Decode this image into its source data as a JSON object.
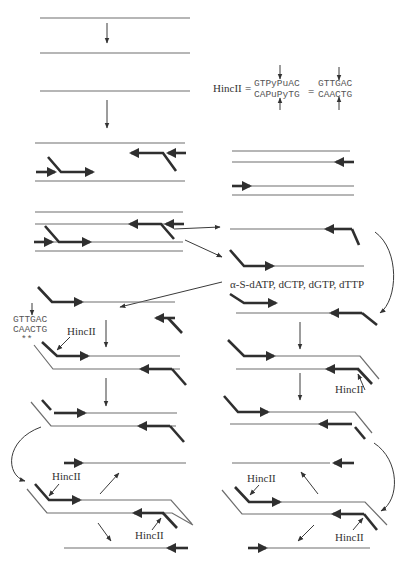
{
  "diagram": {
    "enzyme_label": "HincII",
    "equals": "=",
    "site_generic": {
      "top": "GTPyPuAC",
      "bottom": "CAPuPyTG"
    },
    "site_specific": {
      "top": "GTTGAC",
      "bottom": "CAACTG"
    },
    "nucleotides": "α-S-dATP, dCTP, dGTP, dTTP",
    "hemi_site": {
      "top": "GTTGAC",
      "bottom": "CAACTG",
      "marks": "**"
    },
    "labels": {
      "hincii_1": "HincII",
      "hincii_2": "HincII",
      "hincii_3": "HincII",
      "hincii_4": "HincII",
      "hincii_5": "HincII",
      "hincii_6": "HincII"
    }
  }
}
